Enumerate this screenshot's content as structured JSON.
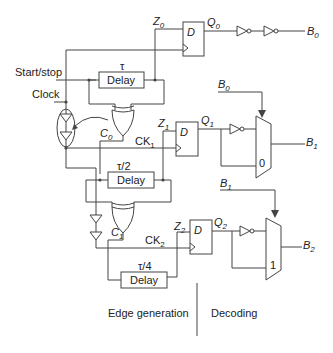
{
  "diagram": {
    "inputs": {
      "start_stop": "Start/stop",
      "clock": "Clock"
    },
    "delays": [
      {
        "tau": "τ",
        "label": "Delay"
      },
      {
        "tau": "τ/2",
        "label": "Delay"
      },
      {
        "tau": "τ/4",
        "label": "Delay"
      }
    ],
    "signals": {
      "z0": "Z",
      "z0_sub": "0",
      "z1": "Z",
      "z1_sub": "1",
      "z2": "Z",
      "z2_sub": "2",
      "q0": "Q",
      "q0_sub": "0",
      "q1": "Q",
      "q1_sub": "1",
      "q2": "Q",
      "q2_sub": "2",
      "c0": "C",
      "c0_sub": "0",
      "c1": "C",
      "c1_sub": "1",
      "ck1": "CK",
      "ck1_sub": "1",
      "ck2": "CK",
      "ck2_sub": "2"
    },
    "flipflops": [
      {
        "d": "D"
      },
      {
        "d": "D"
      },
      {
        "d": "D"
      }
    ],
    "outputs": {
      "b0": "B",
      "b0_sub": "0",
      "b1": "B",
      "b1_sub": "1",
      "b2": "B",
      "b2_sub": "2"
    },
    "mux_inputs": {
      "sel_b0": "B",
      "sel_b0_sub": "0",
      "sel_b1": "B",
      "sel_b1_sub": "1",
      "mux1_label": "0",
      "mux2_label": "1"
    },
    "sections": {
      "left": "Edge generation",
      "right": "Decoding"
    }
  }
}
